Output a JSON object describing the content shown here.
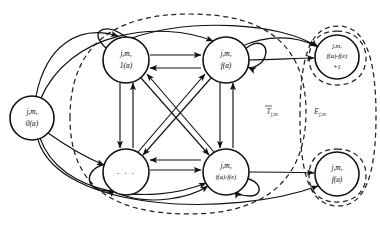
{
  "diagram": {
    "type": "state-transition-graph",
    "colors": {
      "node_stroke": "#111111",
      "node_fill": "#ffffff",
      "edge": "#111111",
      "region_dashed": "#222222",
      "background": "#ffffff"
    },
    "nodes": [
      {
        "id": "n0",
        "name": "node-state-0a",
        "line1": "j,m,",
        "line2": "0(a)",
        "line3": "",
        "cx": 32,
        "cy": 118,
        "r": 22
      },
      {
        "id": "n1",
        "name": "node-state-1a",
        "line1": "j,m,",
        "line2": "1(a)",
        "line3": "",
        "cx": 126,
        "cy": 60,
        "r": 23
      },
      {
        "id": "n2",
        "name": "node-state-fa",
        "line1": "j,m,",
        "line2": "f(a)",
        "line3": "",
        "cx": 226,
        "cy": 60,
        "r": 23
      },
      {
        "id": "n3",
        "name": "node-state-ellipsis",
        "line1": "",
        "line2": "· · ·",
        "line3": "",
        "cx": 126,
        "cy": 172,
        "r": 23
      },
      {
        "id": "n4",
        "name": "node-state-fa-minus-fe",
        "line1": "j,m,",
        "line2": "f(a)-f(e)",
        "line3": "",
        "cx": 226,
        "cy": 172,
        "r": 23
      },
      {
        "id": "n5",
        "name": "node-state-fa-minus-fe-plus-1",
        "line1": "j,m,",
        "line2": "f(a)-f(e)",
        "line3": "+1",
        "cx": 337,
        "cy": 57,
        "r": 22
      },
      {
        "id": "n6",
        "name": "node-state-fa-terminal",
        "line1": "j,m,",
        "line2": "f(a)",
        "line3": "",
        "cx": 337,
        "cy": 174,
        "r": 22
      }
    ],
    "regions": [
      {
        "id": "r1",
        "name": "region-transient-tbar",
        "label_letter": "T",
        "label_sub": "j,m",
        "overbar": true,
        "label_x": 272,
        "label_y": 114
      },
      {
        "id": "r2",
        "name": "region-absorbing-e",
        "label_letter": "E",
        "label_sub": "j,m",
        "overbar": false,
        "label_x": 320,
        "label_y": 114
      }
    ],
    "edges_description": "Fully connected bidirectional core of four states with self-loops, feeding from initial state 0(a) and out to the two absorbing states."
  }
}
